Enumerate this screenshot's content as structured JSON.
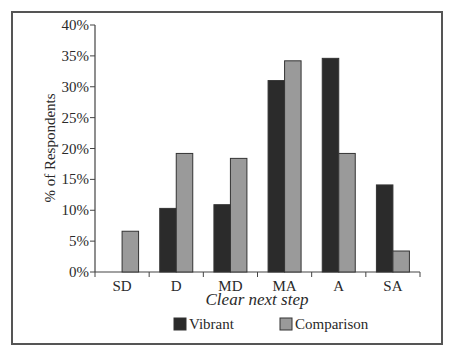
{
  "chart_data": {
    "type": "bar",
    "title": "",
    "xlabel": "Clear next step",
    "ylabel": "% of Respondents",
    "categories": [
      "SD",
      "D",
      "MD",
      "MA",
      "A",
      "SA"
    ],
    "series": [
      {
        "name": "Vibrant",
        "color": "#2b2b2b",
        "values": [
          0.0,
          10.3,
          10.9,
          31.0,
          34.6,
          14.1
        ]
      },
      {
        "name": "Comparison",
        "color": "#9a9a9a",
        "values": [
          6.6,
          19.2,
          18.4,
          34.2,
          19.2,
          3.4
        ]
      }
    ],
    "ylim": [
      0,
      40
    ],
    "yticks": [
      0,
      5,
      10,
      15,
      20,
      25,
      30,
      35,
      40
    ],
    "ytick_labels": [
      "0%",
      "5%",
      "10%",
      "15%",
      "20%",
      "25%",
      "30%",
      "35%",
      "40%"
    ],
    "grid": false,
    "legend_position": "bottom"
  }
}
